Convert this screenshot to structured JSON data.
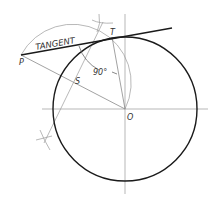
{
  "figure": {
    "labels": {
      "tangent": "TANGENT",
      "point_p": "P",
      "point_t": "T",
      "point_s": "S",
      "point_o": "O",
      "angle": "90°"
    },
    "colors": {
      "circle": "#1a1a1a",
      "tangent_line": "#1a1a1a",
      "construction": "#8a8a8a",
      "text": "#333333"
    }
  }
}
